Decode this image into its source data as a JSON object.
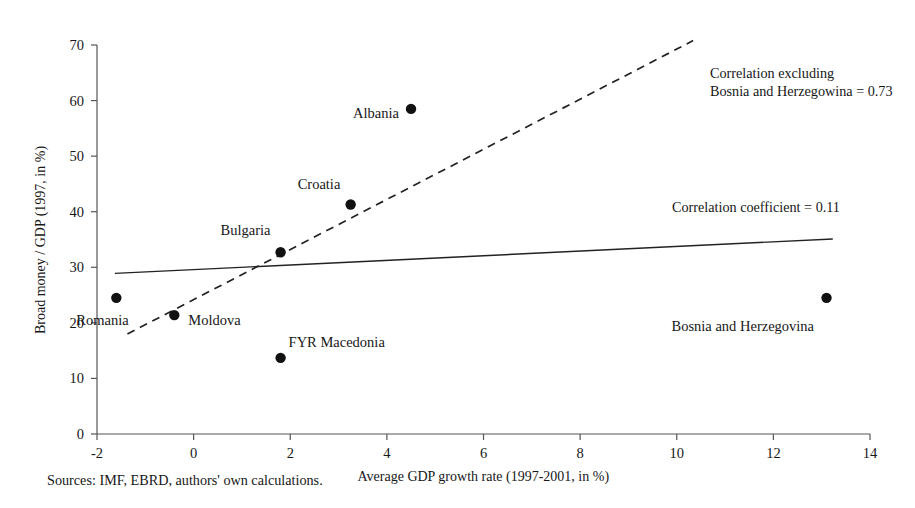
{
  "chart_data": {
    "type": "scatter",
    "title": "",
    "xlabel": "Average GDP growth rate (1997-2001, in %)",
    "ylabel": "Broad money / GDP (1997, in %)",
    "xlim": [
      -2,
      14
    ],
    "ylim": [
      0,
      70
    ],
    "xticks": [
      -2,
      0,
      2,
      4,
      6,
      8,
      10,
      12,
      14
    ],
    "yticks": [
      0,
      10,
      20,
      30,
      40,
      50,
      60,
      70
    ],
    "xtick_labels": [
      "-2",
      "0",
      "2",
      "4",
      "6",
      "8",
      "10",
      "12",
      "14"
    ],
    "ytick_labels": [
      "0",
      "10",
      "20",
      "30",
      "40",
      "50",
      "60",
      "70"
    ],
    "grid": false,
    "legend": "none",
    "points": [
      {
        "label": "Romania",
        "x": -1.6,
        "y": 24.5,
        "label_dx": -6,
        "label_dy": 22,
        "label_anchor": "start",
        "label_offset_x": -40
      },
      {
        "label": "Moldova",
        "x": -0.4,
        "y": 21.4,
        "label_dx": 14,
        "label_dy": 5,
        "label_anchor": "start",
        "label_offset_x": 14
      },
      {
        "label": "FYR Macedonia",
        "x": 1.8,
        "y": 13.7,
        "label_dx": 8,
        "label_dy": -16,
        "label_anchor": "start",
        "label_offset_x": 8
      },
      {
        "label": "Bulgaria",
        "x": 1.8,
        "y": 32.7,
        "label_dx": -10,
        "label_dy": -22,
        "label_anchor": "end",
        "label_offset_x": -10
      },
      {
        "label": "Croatia",
        "x": 3.25,
        "y": 41.3,
        "label_dx": -10,
        "label_dy": -20,
        "label_anchor": "end",
        "label_offset_x": -10
      },
      {
        "label": "Albania",
        "x": 4.5,
        "y": 58.5,
        "label_dx": -12,
        "label_dy": 4,
        "label_anchor": "end",
        "label_offset_x": -12
      },
      {
        "label": "Bosnia and Herzegovina",
        "x": 13.1,
        "y": 24.5,
        "label_dx": -12,
        "label_dy": 28,
        "label_anchor": "end",
        "label_offset_x": -12
      }
    ],
    "series": [
      {
        "name": "Correlation coefficient = 0.11",
        "style": "solid",
        "x0": -1.63,
        "y0": 28.9,
        "x1": 13.23,
        "y1": 35.1
      },
      {
        "name": "Correlation excluding Bosnia and Herzegowina = 0.73",
        "style": "dashed",
        "x0": -1.37,
        "y0": 18.0,
        "x1": 10.34,
        "y1": 70.8
      }
    ],
    "annotations": [
      {
        "id": "correlation-excluding-note",
        "lines": [
          "Correlation excluding",
          "Bosnia and Herzegowina = 0.73"
        ],
        "x": 710,
        "y": 64
      },
      {
        "id": "correlation-coefficient-note",
        "lines": [
          "Correlation coefficient = 0.11"
        ],
        "x": 672,
        "y": 198
      }
    ],
    "source_note": "Sources: IMF, EBRD, authors' own calculations."
  }
}
